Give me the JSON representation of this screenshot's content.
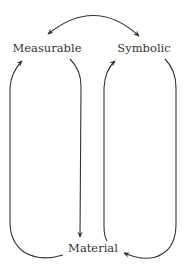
{
  "diagram": {
    "nodes": [
      {
        "id": "measurable",
        "label": "Measurable"
      },
      {
        "id": "symbolic",
        "label": "Symbolic"
      },
      {
        "id": "material",
        "label": "Material"
      }
    ],
    "edges": [
      {
        "from": "measurable",
        "to": "symbolic",
        "type": "bidirectional-arc"
      },
      {
        "from": "measurable",
        "to": "material",
        "type": "arrow"
      },
      {
        "from": "material",
        "to": "measurable",
        "type": "loop-arrow"
      },
      {
        "from": "material",
        "to": "symbolic",
        "type": "arrow"
      },
      {
        "from": "symbolic",
        "to": "material",
        "type": "loop-arrow"
      }
    ],
    "colors": {
      "stroke": "#333333",
      "text": "#333333",
      "background": "#ffffff"
    }
  }
}
